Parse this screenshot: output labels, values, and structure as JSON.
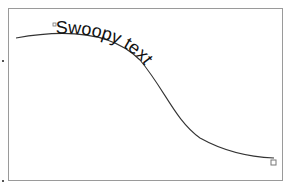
{
  "canvas": {
    "text_on_path": "Swoopy text",
    "colors": {
      "frame": "#9a9a9a",
      "curve": "#333333",
      "text": "#111111",
      "handle": "#777777"
    }
  },
  "handles": {
    "start": "path-start-handle",
    "end": "path-end-handle"
  }
}
